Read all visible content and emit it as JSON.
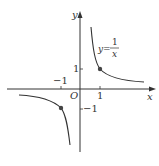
{
  "diagram": {
    "function_label": {
      "lhs": "y=",
      "numerator": "1",
      "denominator": "x"
    },
    "axes": {
      "x_label": "x",
      "y_label": "y",
      "origin_label": "O"
    },
    "ticks": {
      "x_pos": "1",
      "x_neg": "−1",
      "y_pos": "1",
      "y_neg": "−1"
    },
    "points": [
      {
        "x": 1,
        "y": 1
      },
      {
        "x": -1,
        "y": -1
      }
    ],
    "colors": {
      "curve": "#333333",
      "axes": "#333333",
      "point": "#444444"
    }
  }
}
